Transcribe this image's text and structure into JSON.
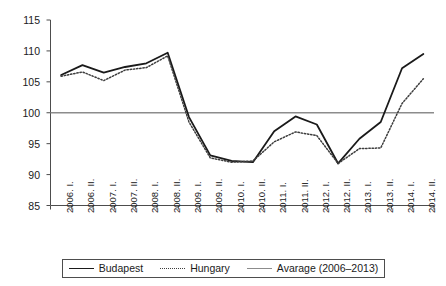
{
  "chart_data": {
    "type": "line",
    "title": "",
    "xlabel": "",
    "ylabel": "",
    "ylim": [
      85,
      115
    ],
    "yticks": [
      85,
      90,
      95,
      100,
      105,
      110,
      115
    ],
    "grid": false,
    "legend_position": "bottom",
    "categories": [
      "2006. I.",
      "2006. II.",
      "2007. I.",
      "2007. II.",
      "2008. I.",
      "2008. II.",
      "2009. I.",
      "2009. II.",
      "2010. I.",
      "2010. II.",
      "2011. I.",
      "2011. II.",
      "2012. I.",
      "2012. II.",
      "2013. I.",
      "2013. II.",
      "2014. I.",
      "2014. II."
    ],
    "series": [
      {
        "name": "Budapest",
        "style": "solid",
        "color": "#1a1a1a",
        "values": [
          106.1,
          107.7,
          106.5,
          107.4,
          108.0,
          109.7,
          99.3,
          93.1,
          92.2,
          92.0,
          97.0,
          99.4,
          98.1,
          91.8,
          95.8,
          98.5,
          107.2,
          109.5
        ]
      },
      {
        "name": "Hungary",
        "style": "dotted",
        "color": "#3d3d3d",
        "values": [
          105.9,
          106.6,
          105.2,
          106.9,
          107.3,
          109.2,
          98.5,
          92.7,
          92.0,
          92.2,
          95.3,
          96.9,
          96.3,
          91.8,
          94.2,
          94.3,
          101.5,
          105.5
        ]
      }
    ],
    "reference_line": {
      "name": "Avarage (2006–2013)",
      "style": "solid",
      "color": "#8c8c8c",
      "value": 100
    },
    "legend": [
      {
        "label": "Budapest",
        "swatch": "sw-solid-dark"
      },
      {
        "label": "Hungary",
        "swatch": "sw-dotted"
      },
      {
        "label": "Avarage (2006–2013)",
        "swatch": "sw-solid-gray"
      }
    ]
  }
}
